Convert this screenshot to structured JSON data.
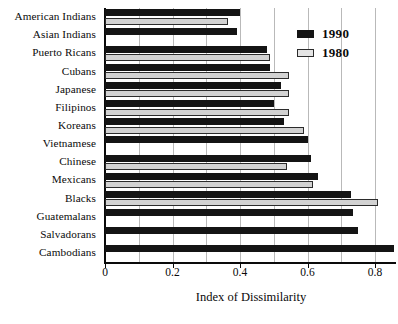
{
  "chart_data": {
    "type": "bar",
    "orientation": "horizontal",
    "title": "",
    "xlabel": "Index of Dissimilarity",
    "ylabel": "",
    "xlim": [
      0,
      0.9
    ],
    "xticks": [
      0,
      0.2,
      0.4,
      0.6,
      0.8
    ],
    "xtick_labels": [
      "0",
      "0.2",
      "0.4",
      "0.6",
      "0.8"
    ],
    "gridlines": [
      0.1,
      0.2,
      0.3,
      0.4,
      0.5,
      0.6,
      0.7,
      0.8
    ],
    "grid": true,
    "legend_position": "upper right",
    "categories": [
      "American Indians",
      "Asian Indians",
      "Puerto Ricans",
      "Cubans",
      "Japanese",
      "Filipinos",
      "Koreans",
      "Vietnamese",
      "Chinese",
      "Mexicans",
      "Blacks",
      "Guatemalans",
      "Salvadorans",
      "Cambodians"
    ],
    "series": [
      {
        "name": "1990",
        "color": "#141414",
        "values": [
          0.4,
          0.39,
          0.48,
          0.49,
          0.52,
          0.5,
          0.53,
          0.6,
          0.61,
          0.63,
          0.73,
          0.735,
          0.75,
          0.855
        ]
      },
      {
        "name": "1980",
        "color": "#d2d2d2",
        "values": [
          0.365,
          null,
          0.49,
          0.545,
          0.545,
          0.545,
          0.59,
          null,
          0.54,
          0.615,
          0.81,
          null,
          null,
          null
        ]
      }
    ]
  },
  "legend": {
    "items": [
      {
        "label": "1990",
        "swatch": "black-swatch"
      },
      {
        "label": "1980",
        "swatch": "light-swatch"
      }
    ]
  }
}
